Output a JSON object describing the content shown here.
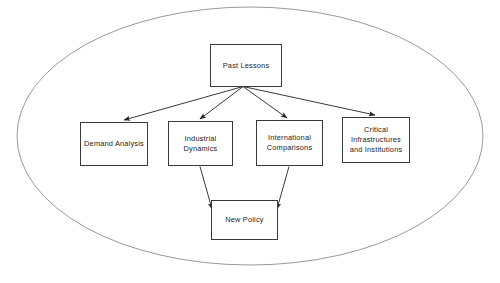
{
  "diagram": {
    "type": "flowchart",
    "title": "",
    "boundary": {
      "shape": "ellipse",
      "name": "enclosing-ellipse",
      "center_x": 250,
      "center_y": 136,
      "radius_x": 233,
      "radius_y": 129,
      "stroke": "#8d8d8d",
      "fill": "none",
      "stroke_width": 0.9
    },
    "nodes": [
      {
        "id": "past-lessons",
        "label": "Past  Lessons",
        "x": 210,
        "y": 44,
        "width": 72,
        "height": 43,
        "stroke": "#3a3a3a",
        "fill": "#ffffff"
      },
      {
        "id": "demand-analysis",
        "label": "Demand Analysis",
        "x": 80,
        "y": 122,
        "width": 68,
        "height": 44,
        "stroke": "#3a3a3a",
        "fill": "#ffffff"
      },
      {
        "id": "industrial-dynamics",
        "label": "Industrial\nDynamics",
        "x": 168,
        "y": 121,
        "width": 65,
        "height": 45,
        "stroke": "#3a3a3a",
        "fill": "#ffffff"
      },
      {
        "id": "international-comparisons",
        "label": "International\nComparisons",
        "x": 256,
        "y": 120,
        "width": 67,
        "height": 46,
        "stroke": "#3a3a3a",
        "fill": "#ffffff"
      },
      {
        "id": "critical-infrastructures",
        "label": "Critical\nInfrastructures\nand Institutions",
        "x": 342,
        "y": 117,
        "width": 68,
        "height": 46,
        "stroke": "#3a3a3a",
        "fill": "#ffffff"
      },
      {
        "id": "new-policy",
        "label": "New Policy",
        "x": 211,
        "y": 200,
        "width": 67,
        "height": 40,
        "stroke": "#3a3a3a",
        "fill": "#ffffff"
      }
    ],
    "edges": [
      {
        "id": "past-to-demand",
        "from": "past-lessons",
        "to": "demand-analysis",
        "arrowhead": "filled-triangle",
        "stroke": "#222222"
      },
      {
        "id": "past-to-industrial",
        "from": "past-lessons",
        "to": "industrial-dynamics",
        "arrowhead": "filled-triangle",
        "stroke": "#222222"
      },
      {
        "id": "past-to-international",
        "from": "past-lessons",
        "to": "international-comparisons",
        "arrowhead": "filled-triangle",
        "stroke": "#222222"
      },
      {
        "id": "past-to-critical",
        "from": "past-lessons",
        "to": "critical-infrastructures",
        "arrowhead": "filled-triangle",
        "stroke": "#222222"
      },
      {
        "id": "industrial-to-policy",
        "from": "industrial-dynamics",
        "to": "new-policy",
        "arrowhead": "filled-triangle",
        "stroke": "#222222"
      },
      {
        "id": "international-to-policy",
        "from": "international-comparisons",
        "to": "new-policy",
        "arrowhead": "filled-triangle",
        "stroke": "#222222"
      }
    ]
  }
}
